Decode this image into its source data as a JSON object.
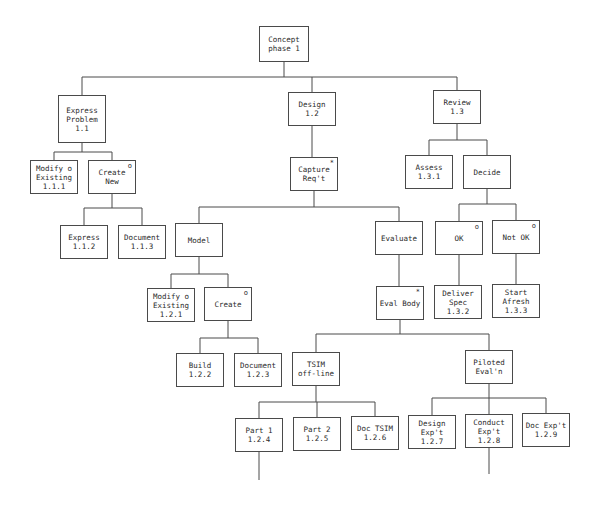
{
  "diagram": {
    "type": "tree",
    "line_color": "#4a4a4a",
    "nodes": [
      {
        "id": "n1",
        "lines": [
          "Concept",
          "phase 1"
        ],
        "mark": "",
        "x": 259,
        "y": 26,
        "w": 50,
        "h": 36
      },
      {
        "id": "n11",
        "lines": [
          "Express",
          "Problem",
          "1.1"
        ],
        "mark": "",
        "x": 58,
        "y": 95,
        "w": 48,
        "h": 48
      },
      {
        "id": "n12",
        "lines": [
          "Design",
          "1.2"
        ],
        "mark": "",
        "x": 288,
        "y": 92,
        "w": 48,
        "h": 34
      },
      {
        "id": "n13",
        "lines": [
          "Review",
          "1.3"
        ],
        "mark": "",
        "x": 433,
        "y": 90,
        "w": 48,
        "h": 34
      },
      {
        "id": "n111",
        "lines": [
          "Modify o",
          "Existing",
          "1.1.1"
        ],
        "mark": "",
        "x": 30,
        "y": 160,
        "w": 48,
        "h": 34
      },
      {
        "id": "ncn",
        "lines": [
          "Create",
          "New"
        ],
        "mark": "o",
        "x": 88,
        "y": 160,
        "w": 48,
        "h": 34
      },
      {
        "id": "ncr",
        "lines": [
          "Capture",
          "Req't"
        ],
        "mark": "*",
        "x": 290,
        "y": 157,
        "w": 48,
        "h": 34
      },
      {
        "id": "n131",
        "lines": [
          "Assess",
          "1.3.1"
        ],
        "mark": "",
        "x": 405,
        "y": 155,
        "w": 48,
        "h": 34
      },
      {
        "id": "ndec",
        "lines": [
          "Decide"
        ],
        "mark": "",
        "x": 463,
        "y": 155,
        "w": 48,
        "h": 34
      },
      {
        "id": "n112",
        "lines": [
          "Express",
          "1.1.2"
        ],
        "mark": "",
        "x": 60,
        "y": 225,
        "w": 48,
        "h": 34
      },
      {
        "id": "n113",
        "lines": [
          "Document",
          "1.1.3"
        ],
        "mark": "",
        "x": 118,
        "y": 225,
        "w": 48,
        "h": 34
      },
      {
        "id": "nmod",
        "lines": [
          "Model"
        ],
        "mark": "",
        "x": 175,
        "y": 223,
        "w": 48,
        "h": 34
      },
      {
        "id": "neva",
        "lines": [
          "Evaluate"
        ],
        "mark": "",
        "x": 375,
        "y": 221,
        "w": 48,
        "h": 34
      },
      {
        "id": "nok",
        "lines": [
          "OK"
        ],
        "mark": "o",
        "x": 435,
        "y": 221,
        "w": 48,
        "h": 34
      },
      {
        "id": "nnok",
        "lines": [
          "Not OK"
        ],
        "mark": "o",
        "x": 492,
        "y": 220,
        "w": 48,
        "h": 34
      },
      {
        "id": "n121",
        "lines": [
          "Modify o",
          "Existing",
          "1.2.1"
        ],
        "mark": "",
        "x": 147,
        "y": 288,
        "w": 48,
        "h": 34
      },
      {
        "id": "ncre",
        "lines": [
          "Create"
        ],
        "mark": "o",
        "x": 204,
        "y": 287,
        "w": 48,
        "h": 34
      },
      {
        "id": "nevb",
        "lines": [
          "Eval Body"
        ],
        "mark": "*",
        "x": 376,
        "y": 286,
        "w": 48,
        "h": 34
      },
      {
        "id": "n132",
        "lines": [
          "Deliver",
          "Spec",
          "1.3.2"
        ],
        "mark": "",
        "x": 434,
        "y": 285,
        "w": 48,
        "h": 34
      },
      {
        "id": "n133",
        "lines": [
          "Start",
          "Afresh",
          "1.3.3"
        ],
        "mark": "",
        "x": 492,
        "y": 284,
        "w": 48,
        "h": 34
      },
      {
        "id": "n122",
        "lines": [
          "Build",
          "1.2.2"
        ],
        "mark": "",
        "x": 176,
        "y": 353,
        "w": 48,
        "h": 34
      },
      {
        "id": "n123",
        "lines": [
          "Document",
          "1.2.3"
        ],
        "mark": "",
        "x": 234,
        "y": 353,
        "w": 48,
        "h": 34
      },
      {
        "id": "ntsim",
        "lines": [
          "TSIM",
          "off-line"
        ],
        "mark": "",
        "x": 292,
        "y": 352,
        "w": 48,
        "h": 34
      },
      {
        "id": "npil",
        "lines": [
          "Piloted",
          "Eval'n"
        ],
        "mark": "",
        "x": 465,
        "y": 350,
        "w": 48,
        "h": 34
      },
      {
        "id": "n124",
        "lines": [
          "Part 1",
          "1.2.4"
        ],
        "mark": "",
        "x": 235,
        "y": 418,
        "w": 48,
        "h": 34
      },
      {
        "id": "n125",
        "lines": [
          "Part 2",
          "1.2.5"
        ],
        "mark": "",
        "x": 293,
        "y": 417,
        "w": 48,
        "h": 34
      },
      {
        "id": "n126",
        "lines": [
          "Doc TSIM",
          "1.2.6"
        ],
        "mark": "",
        "x": 351,
        "y": 416,
        "w": 48,
        "h": 34
      },
      {
        "id": "n127",
        "lines": [
          "Design",
          "Exp't",
          "1.2.7"
        ],
        "mark": "",
        "x": 408,
        "y": 415,
        "w": 48,
        "h": 34
      },
      {
        "id": "n128",
        "lines": [
          "Conduct",
          "Exp't",
          "1.2.8"
        ],
        "mark": "",
        "x": 465,
        "y": 414,
        "w": 48,
        "h": 34
      },
      {
        "id": "n129",
        "lines": [
          "Doc Exp't",
          "1.2.9"
        ],
        "mark": "",
        "x": 522,
        "y": 413,
        "w": 48,
        "h": 34
      }
    ],
    "connectors": [
      {
        "parent": "n1",
        "bus_y": 77,
        "children": [
          "n11",
          "n12",
          "n13"
        ]
      },
      {
        "parent": "n11",
        "bus_y": 152,
        "children": [
          "n111",
          "ncn"
        ]
      },
      {
        "parent": "n12",
        "bus_y": 0,
        "children": [
          "ncr"
        ]
      },
      {
        "parent": "n13",
        "bus_y": 140,
        "children": [
          "n131",
          "ndec"
        ]
      },
      {
        "parent": "ncn",
        "bus_y": 208,
        "children": [
          "n112",
          "n113"
        ]
      },
      {
        "parent": "ncr",
        "bus_y": 207,
        "children": [
          "nmod",
          "neva"
        ]
      },
      {
        "parent": "ndec",
        "bus_y": 204,
        "children": [
          "nok",
          "nnok"
        ]
      },
      {
        "parent": "nmod",
        "bus_y": 274,
        "children": [
          "n121",
          "ncre"
        ]
      },
      {
        "parent": "neva",
        "bus_y": 0,
        "children": [
          "nevb"
        ]
      },
      {
        "parent": "nok",
        "bus_y": 0,
        "children": [
          "n132"
        ]
      },
      {
        "parent": "nnok",
        "bus_y": 0,
        "children": [
          "n133"
        ]
      },
      {
        "parent": "ncre",
        "bus_y": 338,
        "children": [
          "n122",
          "n123"
        ]
      },
      {
        "parent": "nevb",
        "bus_y": 334,
        "children": [
          "ntsim",
          "npil"
        ]
      },
      {
        "parent": "ntsim",
        "bus_y": 402,
        "children": [
          "n124",
          "n125",
          "n126"
        ]
      },
      {
        "parent": "npil",
        "bus_y": 398,
        "children": [
          "n127",
          "n128",
          "n129"
        ]
      }
    ],
    "tails": [
      {
        "from": "n124",
        "length": 28
      },
      {
        "from": "n128",
        "length": 26
      }
    ]
  }
}
